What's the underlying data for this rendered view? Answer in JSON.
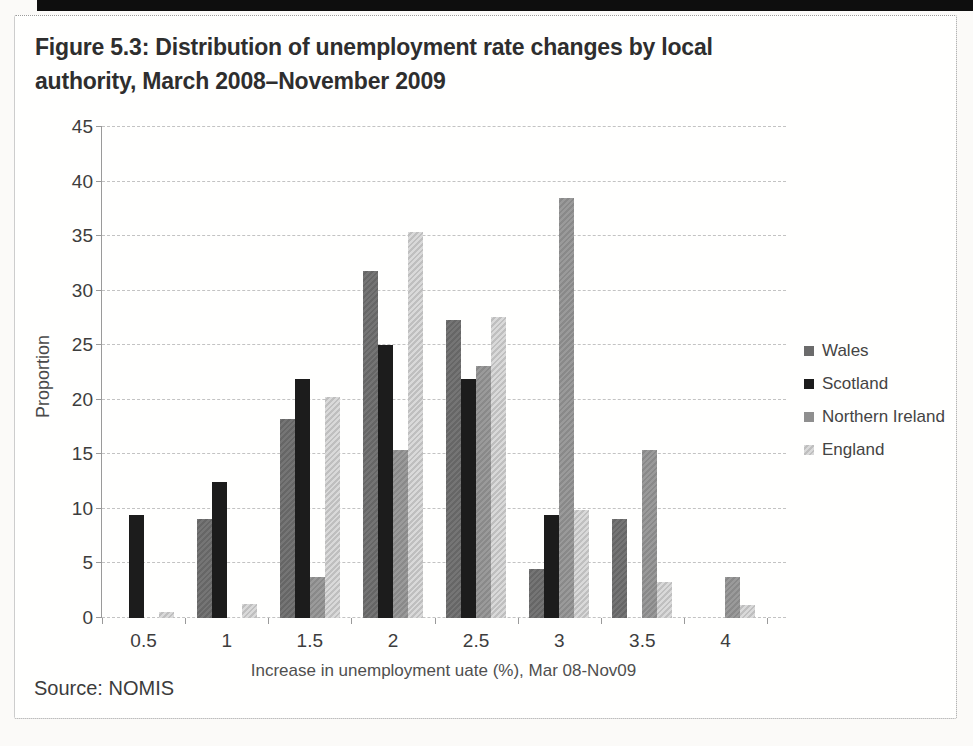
{
  "figure": {
    "title_line1": "Figure 5.3: Distribution of unemployment rate changes by local",
    "title_line2": "authority, March 2008–November 2009",
    "source": "Source: NOMIS"
  },
  "chart_data": {
    "type": "bar",
    "title": "Figure 5.3: Distribution of unemployment rate changes by local authority, March 2008–November 2009",
    "categories": [
      "0.5",
      "1",
      "1.5",
      "2",
      "2.5",
      "3",
      "3.5",
      "4"
    ],
    "series": [
      {
        "name": "Wales",
        "color": "#6b6b6b",
        "values": [
          0,
          9.1,
          18.2,
          31.8,
          27.3,
          4.5,
          9.1,
          0
        ]
      },
      {
        "name": "Scotland",
        "color": "#1c1c1c",
        "values": [
          9.4,
          12.5,
          21.9,
          25.0,
          21.9,
          9.4,
          0,
          0
        ]
      },
      {
        "name": "Northern Ireland",
        "color": "#8f8f8f",
        "values": [
          0,
          0,
          3.8,
          15.4,
          23.1,
          38.5,
          15.4,
          3.8
        ]
      },
      {
        "name": "England",
        "color": "#c9c9c9",
        "values": [
          0.6,
          1.3,
          20.3,
          35.4,
          27.6,
          9.9,
          3.3,
          1.2
        ]
      }
    ],
    "xlabel": "Increase in unemployment uate (%), Mar 08-Nov09",
    "ylabel": "Proportion",
    "ylim": [
      0,
      45
    ],
    "ytick_step": 5,
    "grid": "horizontal-dashed",
    "legend_position": "right"
  }
}
